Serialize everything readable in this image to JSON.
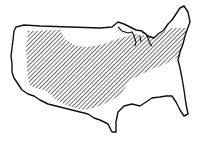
{
  "map": {
    "subject": "Contiguous United States outline",
    "style": "black line drawing with diagonal hatching",
    "colors": {
      "background": "#ffffff",
      "outline": "#111111",
      "hatch": "#222222"
    },
    "regions": [
      {
        "name": "hatched-region",
        "description": "Diagonally hatched area covering the central, midwestern and northeastern US"
      }
    ]
  }
}
